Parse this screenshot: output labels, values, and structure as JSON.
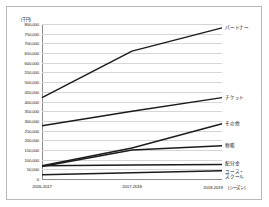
{
  "chart_data": {
    "type": "line",
    "title": "",
    "subtitle": "",
    "xlabel": "",
    "ylabel": "（千円）",
    "unit_label": "（千円）",
    "season_note": "（シーズン）",
    "grid": true,
    "legend_position": "right-inline",
    "categories": [
      "2016-2017",
      "2017-2018",
      "2018-2019"
    ],
    "ylim": [
      0,
      800000
    ],
    "ytick_step": 50000,
    "yticks": [
      "800,000",
      "750,000",
      "700,000",
      "650,000",
      "600,000",
      "550,000",
      "500,000",
      "450,000",
      "400,000",
      "350,000",
      "300,000",
      "250,000",
      "200,000",
      "150,000",
      "100,000",
      "50,000",
      "0"
    ],
    "ytick_values": [
      800000,
      750000,
      700000,
      650000,
      600000,
      550000,
      500000,
      450000,
      400000,
      350000,
      300000,
      250000,
      200000,
      150000,
      100000,
      50000,
      0
    ],
    "series": [
      {
        "name": "パートナー",
        "values": [
          420000,
          660000,
          780000
        ]
      },
      {
        "name": "チケット",
        "values": [
          275000,
          350000,
          420000
        ]
      },
      {
        "name": "その他",
        "values": [
          68000,
          160000,
          285000
        ]
      },
      {
        "name": "物販",
        "values": [
          65000,
          150000,
          172000
        ]
      },
      {
        "name": "配分金",
        "values": [
          68000,
          72000,
          75000
        ]
      },
      {
        "name": "ユース・スクール",
        "values": [
          22000,
          32000,
          42000
        ]
      }
    ]
  },
  "labels": {
    "partner": "パートナー",
    "ticket": "チケット",
    "other": "その他",
    "merch": "物販",
    "distribution": "配分金",
    "youth_line1": "ユース・",
    "youth_line2": "スクール"
  },
  "xaxis": {
    "tick1": "2016-2017",
    "tick2": "2017-2018",
    "tick3": "2018-2019",
    "season_note": "（シーズン）"
  }
}
